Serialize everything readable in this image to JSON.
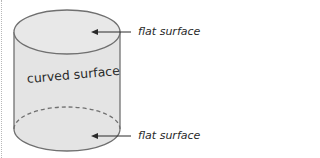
{
  "diagram": {
    "labels": {
      "top": "flat surface",
      "side": "curved surface",
      "bottom": "flat surface"
    },
    "colors": {
      "fill": "#e4e4e4",
      "outline": "#707070",
      "arrow": "#2a2a2a",
      "text": "#2a2a2a"
    }
  }
}
